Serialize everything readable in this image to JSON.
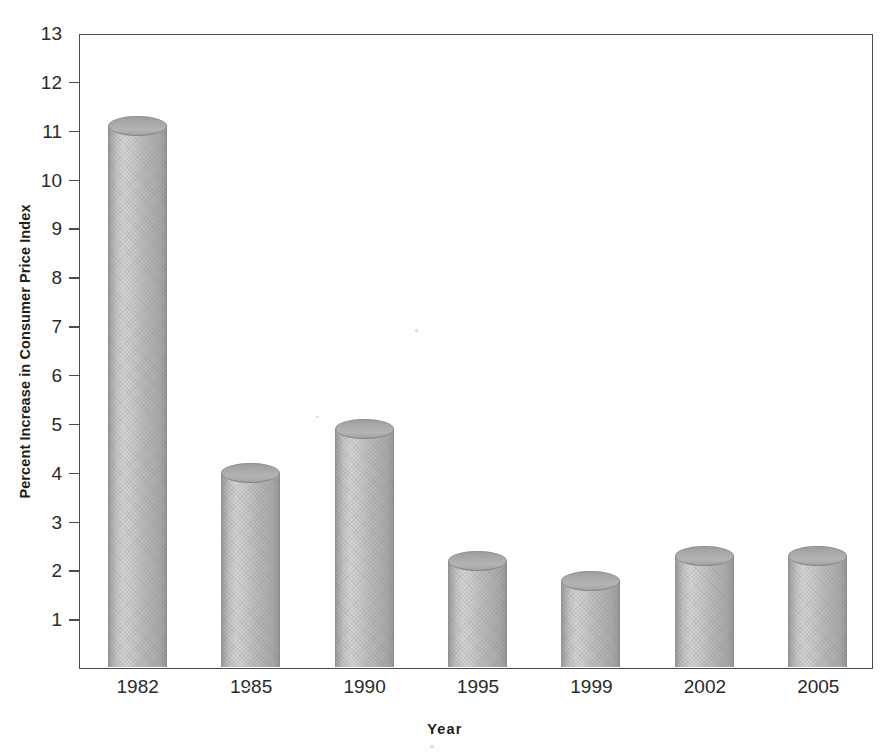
{
  "chart_data": {
    "type": "bar",
    "title": "",
    "xlabel": "Year",
    "ylabel": "Percent Increase in Consumer Price Index",
    "categories": [
      "1982",
      "1985",
      "1990",
      "1995",
      "1999",
      "2002",
      "2005"
    ],
    "values": [
      11.1,
      4.0,
      4.9,
      2.2,
      1.8,
      2.3,
      2.3
    ],
    "ylim": [
      0,
      13
    ],
    "yticks": [
      "1",
      "2",
      "3",
      "4",
      "5",
      "6",
      "7",
      "8",
      "9",
      "10",
      "11",
      "12",
      "13"
    ],
    "ytick_values": [
      1,
      2,
      3,
      4,
      5,
      6,
      7,
      8,
      9,
      10,
      11,
      12,
      13
    ],
    "grid": false,
    "legend": false,
    "legend_position": "none",
    "style": "3d-cylinder-bars",
    "bar_color": "#bfbfbf",
    "bar_edge_color": "#8a8a8a",
    "axis_color": "#4b4b4b",
    "text_color": "#2a2a2a",
    "background_color": "#ffffff"
  },
  "axes": {
    "y_label": "Percent Increase in Consumer Price Index",
    "x_label": "Year"
  }
}
